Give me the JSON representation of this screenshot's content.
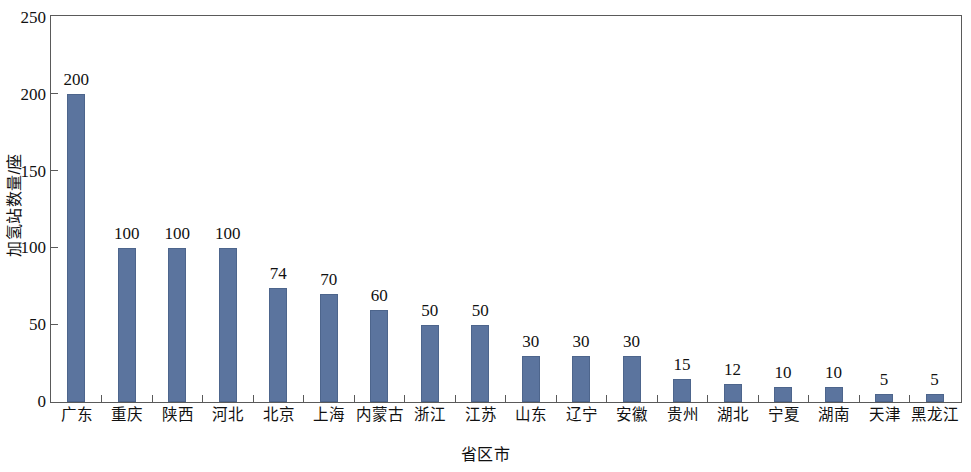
{
  "chart_data": {
    "type": "bar",
    "title": "",
    "xlabel": "省区市",
    "ylabel": "加氢站数量/座",
    "ylim": [
      0,
      250
    ],
    "yticks": [
      0,
      50,
      100,
      150,
      200,
      250
    ],
    "grid": false,
    "legend": null,
    "bar_color": "#5b749e",
    "frame_color": "#5a5a5a",
    "show_value_labels": true,
    "categories": [
      "广东",
      "重庆",
      "陕西",
      "河北",
      "北京",
      "上海",
      "内蒙古",
      "浙江",
      "江苏",
      "山东",
      "辽宁",
      "安徽",
      "贵州",
      "湖北",
      "宁夏",
      "湖南",
      "天津",
      "黑龙江"
    ],
    "values": [
      200,
      100,
      100,
      100,
      74,
      70,
      60,
      50,
      50,
      30,
      30,
      30,
      15,
      12,
      10,
      10,
      5,
      5
    ],
    "value_labels": [
      "200",
      "100",
      "100",
      "100",
      "74",
      "70",
      "60",
      "50",
      "50",
      "30",
      "30",
      "30",
      "15",
      "12",
      "10",
      "10",
      "5",
      "5"
    ],
    "ytick_labels": [
      "0",
      "50",
      "100",
      "150",
      "200",
      "250"
    ]
  }
}
